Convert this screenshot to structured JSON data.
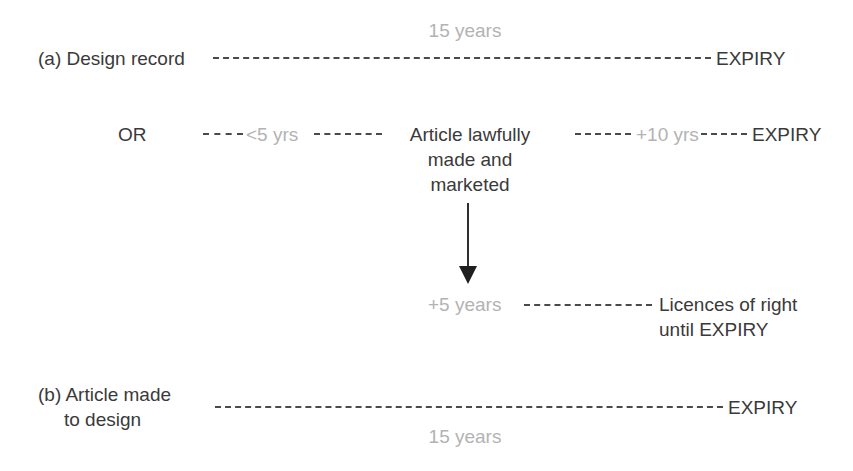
{
  "diagram": {
    "colors": {
      "text_dark": "#3a3a3a",
      "text_gray": "#b3b3b3",
      "line_dark": "#4a4a4a",
      "background": "#ffffff"
    },
    "row_a": {
      "label": "(a) Design record",
      "duration_label": "15 years",
      "end_label": "EXPIRY",
      "connector": "dashed-line"
    },
    "row_or": {
      "or_label": "OR",
      "first_duration": "<5 yrs",
      "middle_block": "Article lawfully made and marketed",
      "middle_block_lines": [
        "Article lawfully",
        "made and",
        "marketed"
      ],
      "second_duration": "+10 yrs",
      "end_label": "EXPIRY",
      "connector": "dashed-line"
    },
    "arrow": {
      "name": "down-arrow",
      "direction": "down"
    },
    "row_licences": {
      "duration_label": "+5 years",
      "result_lines": [
        "Licences of right",
        "until EXPIRY"
      ],
      "result_text": "Licences of right until EXPIRY",
      "connector": "dashed-line"
    },
    "row_b": {
      "label_lines": [
        "(b) Article made",
        "to design"
      ],
      "label": "(b) Article made to design",
      "duration_label": "15 years",
      "end_label": "EXPIRY",
      "connector": "dashed-line"
    }
  }
}
